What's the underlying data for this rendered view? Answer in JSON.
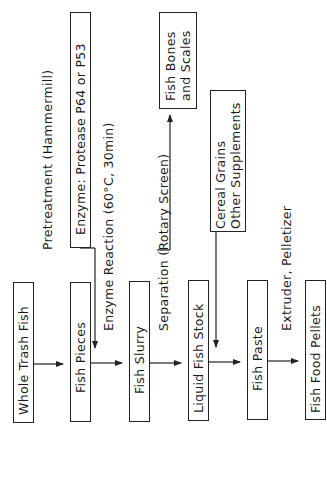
{
  "diagram": {
    "orientation": "rotated -90deg (reads bottom-to-top)",
    "main_flow": [
      {
        "id": "whole-trash-fish",
        "label": "Whole Trash Fish"
      },
      {
        "id": "fish-pieces",
        "label": "Fish Pieces"
      },
      {
        "id": "fish-slurry",
        "label": "Fish Slurry"
      },
      {
        "id": "liquid-fish-stock",
        "label": "Liquid Fish Stock"
      },
      {
        "id": "fish-paste",
        "label": "Fish Paste"
      },
      {
        "id": "fish-food-pellets",
        "label": "Fish Food Pellets"
      }
    ],
    "steps": {
      "pretreatment": "Pretreatment (Hammermill)",
      "enzyme_reaction": "Enzyme Reaction (60°C, 30min)",
      "separation": "Separation (Rotary Screen)",
      "extruder": "Extruder, Pelletizer"
    },
    "side_inputs": {
      "enzyme": "Enzyme: Protease P64 or P53",
      "cereal_line1": "Cereal Grains",
      "cereal_line2": "Other Supplements"
    },
    "side_outputs": {
      "bones_line1": "Fish Bones",
      "bones_line2": "and Scales"
    },
    "colors": {
      "line": "#222222",
      "background": "#ffffff",
      "text": "#1a1a1a"
    }
  }
}
